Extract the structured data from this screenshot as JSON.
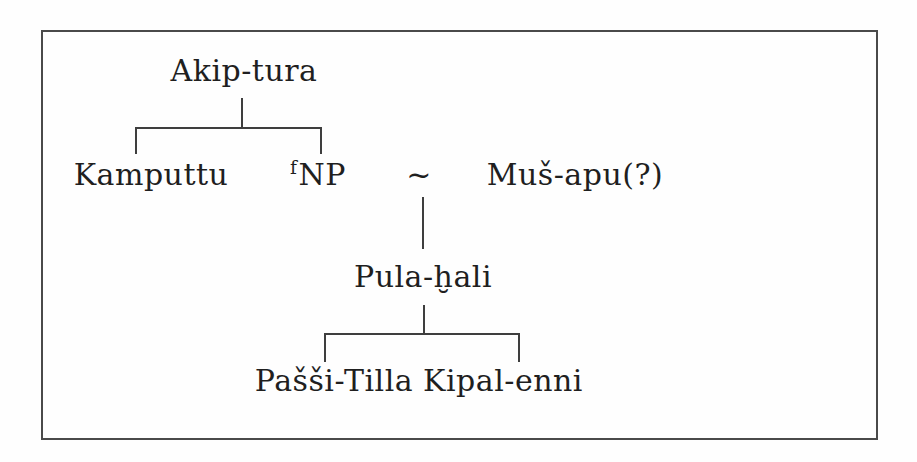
{
  "figure": {
    "type": "genealogy-tree",
    "colors": {
      "ink": "#1f1f1f",
      "connector_line": "#3e3e3e",
      "frame_border": "#4a4a4a",
      "background": "#fefefe"
    },
    "generation1": {
      "root": "Akip-tura"
    },
    "generation2": {
      "child1": "Kamputtu",
      "child2_determinative": "f",
      "child2_name": "NP",
      "marriage_symbol": "~",
      "spouse": "Muš-apu(?)"
    },
    "generation3": {
      "child": "Pula-ḫali"
    },
    "generation4": {
      "child1": "Pašši-Tilla",
      "child2": "Kipal-enni"
    }
  }
}
